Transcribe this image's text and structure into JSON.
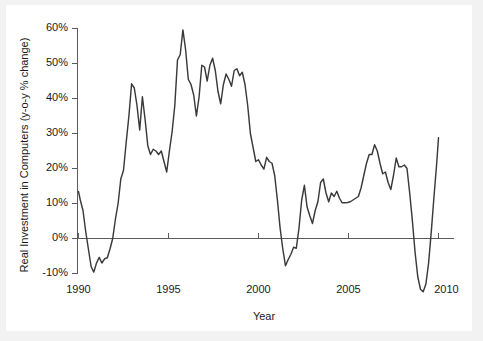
{
  "figure": {
    "background_color": "#f2f2f2",
    "panel_color": "#ffffff",
    "line_color": "#3a3a3a",
    "axis_color": "#5b5b5b"
  },
  "chart_data": {
    "type": "line",
    "title": "",
    "subtitle": "",
    "xlabel": "Year",
    "ylabel": "Real Investment in Computers (y-o-y % change)",
    "xlim": [
      1990,
      2010
    ],
    "ylim": [
      -10,
      60
    ],
    "xticks": [
      1990,
      1995,
      2000,
      2005,
      2010
    ],
    "xtick_labels": [
      "1990",
      "1995",
      "2000",
      "2005",
      "2010"
    ],
    "yticks": [
      -10,
      0,
      10,
      20,
      30,
      40,
      50,
      60
    ],
    "ytick_labels": [
      "-10%",
      "0%",
      "10%",
      "20%",
      "30%",
      "40%",
      "50%",
      "60%"
    ],
    "grid": false,
    "legend": null,
    "legend_position": "none",
    "zero_reference_line": 0,
    "series": [
      {
        "name": "Real Investment in Computers (y-o-y % change)",
        "color": "#3a3a3a",
        "x": [
          1990.0,
          1990.1,
          1990.25,
          1990.4,
          1990.55,
          1990.7,
          1990.85,
          1991.0,
          1991.15,
          1991.3,
          1991.45,
          1991.6,
          1991.75,
          1991.9,
          1992.05,
          1992.2,
          1992.35,
          1992.5,
          1992.65,
          1992.8,
          1992.95,
          1993.1,
          1993.25,
          1993.4,
          1993.55,
          1993.7,
          1993.85,
          1994.0,
          1994.15,
          1994.3,
          1994.45,
          1994.6,
          1994.75,
          1994.9,
          1995.05,
          1995.2,
          1995.35,
          1995.5,
          1995.65,
          1995.8,
          1995.95,
          1996.1,
          1996.25,
          1996.4,
          1996.55,
          1996.7,
          1996.85,
          1997.0,
          1997.15,
          1997.3,
          1997.45,
          1997.6,
          1997.75,
          1997.9,
          1998.05,
          1998.2,
          1998.35,
          1998.5,
          1998.65,
          1998.8,
          1998.95,
          1999.1,
          1999.25,
          1999.4,
          1999.55,
          1999.7,
          1999.85,
          2000.0,
          2000.15,
          2000.3,
          2000.45,
          2000.6,
          2000.75,
          2000.9,
          2001.05,
          2001.2,
          2001.35,
          2001.5,
          2001.65,
          2001.8,
          2001.95,
          2002.1,
          2002.25,
          2002.4,
          2002.55,
          2002.7,
          2002.85,
          2003.0,
          2003.15,
          2003.3,
          2003.45,
          2003.6,
          2003.75,
          2003.9,
          2004.05,
          2004.2,
          2004.35,
          2004.5,
          2004.65,
          2004.8,
          2004.95,
          2005.1,
          2005.25,
          2005.4,
          2005.55,
          2005.7,
          2005.85,
          2006.0,
          2006.15,
          2006.3,
          2006.45,
          2006.6,
          2006.75,
          2006.9,
          2007.05,
          2007.2,
          2007.35,
          2007.5,
          2007.65,
          2007.8,
          2007.95,
          2008.1,
          2008.25,
          2008.4,
          2008.55,
          2008.7,
          2008.85,
          2009.0,
          2009.15,
          2009.3,
          2009.45,
          2009.6,
          2009.75,
          2009.9,
          2010.0
        ],
        "y": [
          13.4,
          11.0,
          8.0,
          2.0,
          -3.0,
          -8.0,
          -9.6,
          -7.0,
          -5.4,
          -7.0,
          -5.8,
          -5.5,
          -3.0,
          0.0,
          5.5,
          10.0,
          17.0,
          19.5,
          27.5,
          35.0,
          44.2,
          43.0,
          38.0,
          31.0,
          40.5,
          34.0,
          26.5,
          24.0,
          25.5,
          25.0,
          24.0,
          25.0,
          22.0,
          19.0,
          25.0,
          30.5,
          38.0,
          51.0,
          52.5,
          59.6,
          54.0,
          45.5,
          44.0,
          41.0,
          35.0,
          40.5,
          49.5,
          49.0,
          45.0,
          49.5,
          51.5,
          48.0,
          42.0,
          38.5,
          44.0,
          47.0,
          45.5,
          43.5,
          48.0,
          48.5,
          46.5,
          47.5,
          44.0,
          38.0,
          30.0,
          26.0,
          22.0,
          22.5,
          21.0,
          19.8,
          23.2,
          22.0,
          21.5,
          18.0,
          11.0,
          3.0,
          -3.0,
          -7.8,
          -6.0,
          -4.5,
          -2.5,
          -2.8,
          3.0,
          11.0,
          15.2,
          9.0,
          6.5,
          4.3,
          8.0,
          10.5,
          16.0,
          17.0,
          13.0,
          10.5,
          13.0,
          12.0,
          13.5,
          11.5,
          10.2,
          10.2,
          10.3,
          10.5,
          11.0,
          11.5,
          12.0,
          14.5,
          18.0,
          21.5,
          24.0,
          24.0,
          26.8,
          25.0,
          21.5,
          18.5,
          19.0,
          16.0,
          14.0,
          18.0,
          23.0,
          20.5,
          20.5,
          21.0,
          20.0,
          13.0,
          5.0,
          -4.0,
          -11.0,
          -14.5,
          -15.2,
          -13.0,
          -7.0,
          2.0,
          12.0,
          21.5,
          28.8
        ]
      }
    ],
    "annotations": []
  }
}
